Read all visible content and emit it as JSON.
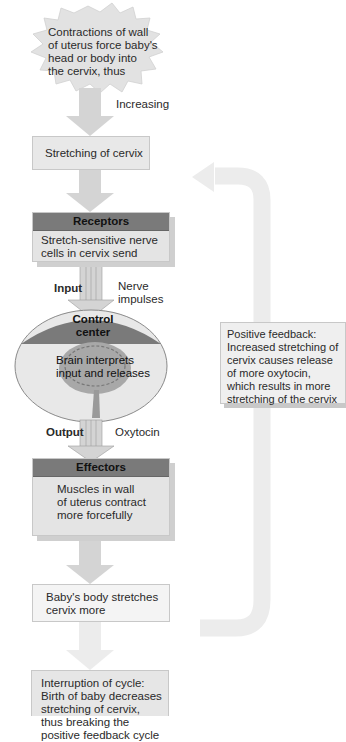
{
  "starburst": {
    "text_lines": [
      "Contractions of wall",
      "of uterus force baby's",
      "head or body into",
      "the cervix, thus"
    ]
  },
  "labels": {
    "increasing": "Increasing",
    "input": "Input",
    "nerve_impulses_1": "Nerve",
    "nerve_impulses_2": "impulses",
    "output": "Output",
    "oxytocin": "Oxytocin"
  },
  "stretching_box": {
    "text": "Stretching of cervix"
  },
  "receptors": {
    "header": "Receptors",
    "lines": [
      "Stretch-sensitive nerve",
      "cells in cervix send"
    ]
  },
  "control_center": {
    "header": "Control center",
    "lines": [
      "Brain interprets",
      "input and releases"
    ]
  },
  "effectors": {
    "header": "Effectors",
    "lines": [
      "Muscles in wall",
      "of uterus contract",
      "more forcefully"
    ]
  },
  "baby_box": {
    "lines": [
      "Baby's body stretches",
      "cervix more"
    ]
  },
  "interruption_box": {
    "lines": [
      "Interruption of cycle:",
      "Birth of baby decreases",
      "stretching of cervix,",
      "thus breaking the",
      "positive feedback cycle"
    ]
  },
  "feedback_box": {
    "lines": [
      "Positive feedback:",
      "Increased stretching of",
      "cervix causes release",
      "of more oxytocin,",
      "which  results in more",
      "stretching of the cervix"
    ]
  },
  "colors": {
    "box_fill": "#e4e4e4",
    "header_fill": "#7a7a7a",
    "arrow_fill": "#d4d4d4",
    "loop_arrow": "#ececec"
  }
}
